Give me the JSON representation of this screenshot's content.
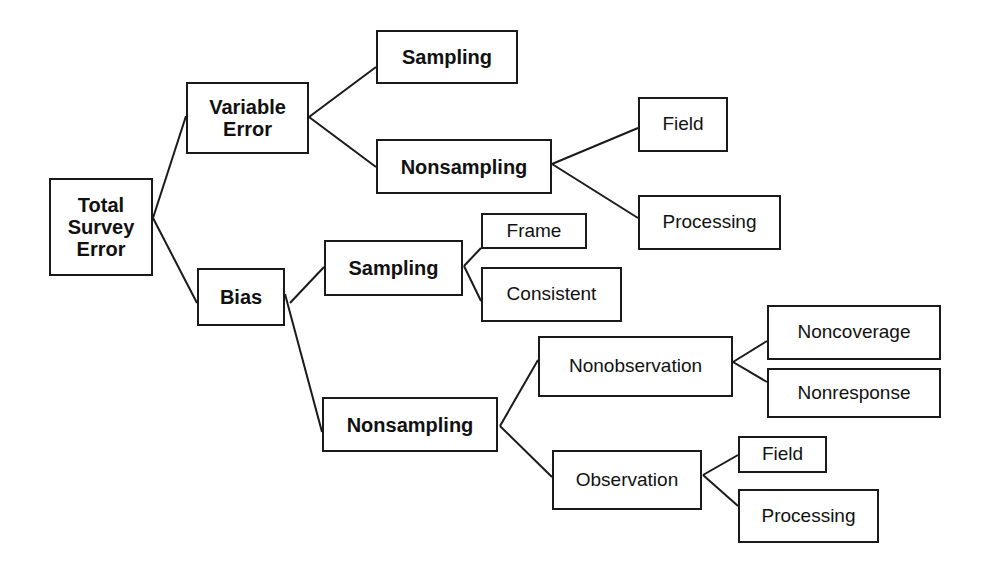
{
  "diagram": {
    "line_color": "#1a1a1a",
    "nodes": [
      {
        "id": "total",
        "label": "Total Survey Error",
        "lines": [
          "Total",
          "Survey",
          "Error"
        ],
        "x": 49,
        "y": 178,
        "w": 104,
        "h": 98,
        "bold": true
      },
      {
        "id": "variable",
        "label": "Variable Error",
        "lines": [
          "Variable",
          "Error"
        ],
        "x": 186,
        "y": 82,
        "w": 123,
        "h": 72,
        "bold": true
      },
      {
        "id": "bias",
        "label": "Bias",
        "lines": [
          "Bias"
        ],
        "x": 197,
        "y": 268,
        "w": 88,
        "h": 58,
        "bold": true
      },
      {
        "id": "var_sampling",
        "label": "Sampling",
        "lines": [
          "Sampling"
        ],
        "x": 376,
        "y": 30,
        "w": 142,
        "h": 54,
        "bold": true
      },
      {
        "id": "var_nonsampling",
        "label": "Nonsampling",
        "lines": [
          "Nonsampling"
        ],
        "x": 376,
        "y": 139,
        "w": 176,
        "h": 55,
        "bold": true
      },
      {
        "id": "var_field",
        "label": "Field",
        "lines": [
          "Field"
        ],
        "x": 638,
        "y": 97,
        "w": 90,
        "h": 55,
        "bold": false
      },
      {
        "id": "var_processing",
        "label": "Processing",
        "lines": [
          "Processing"
        ],
        "x": 638,
        "y": 195,
        "w": 143,
        "h": 55,
        "bold": false
      },
      {
        "id": "bias_sampling",
        "label": "Sampling",
        "lines": [
          "Sampling"
        ],
        "x": 324,
        "y": 240,
        "w": 139,
        "h": 56,
        "bold": true
      },
      {
        "id": "frame",
        "label": "Frame",
        "lines": [
          "Frame"
        ],
        "x": 481,
        "y": 213,
        "w": 106,
        "h": 36,
        "bold": false
      },
      {
        "id": "consistent",
        "label": "Consistent",
        "lines": [
          "Consistent"
        ],
        "x": 481,
        "y": 267,
        "w": 141,
        "h": 55,
        "bold": false
      },
      {
        "id": "bias_nonsampling",
        "label": "Nonsampling",
        "lines": [
          "Nonsampling"
        ],
        "x": 322,
        "y": 397,
        "w": 176,
        "h": 55,
        "bold": true
      },
      {
        "id": "nonobservation",
        "label": "Nonobservation",
        "lines": [
          "Nonobservation"
        ],
        "x": 538,
        "y": 336,
        "w": 195,
        "h": 61,
        "bold": false
      },
      {
        "id": "noncoverage",
        "label": "Noncoverage",
        "lines": [
          "Noncoverage"
        ],
        "x": 767,
        "y": 305,
        "w": 174,
        "h": 55,
        "bold": false
      },
      {
        "id": "nonresponse",
        "label": "Nonresponse",
        "lines": [
          "Nonresponse"
        ],
        "x": 767,
        "y": 368,
        "w": 174,
        "h": 50,
        "bold": false
      },
      {
        "id": "observation",
        "label": "Observation",
        "lines": [
          "Observation"
        ],
        "x": 552,
        "y": 450,
        "w": 150,
        "h": 60,
        "bold": false
      },
      {
        "id": "obs_field",
        "label": "Field",
        "lines": [
          "Field"
        ],
        "x": 738,
        "y": 436,
        "w": 89,
        "h": 37,
        "bold": false
      },
      {
        "id": "obs_processing",
        "label": "Processing",
        "lines": [
          "Processing"
        ],
        "x": 738,
        "y": 489,
        "w": 141,
        "h": 54,
        "bold": false
      }
    ],
    "edges": [
      {
        "from": "total",
        "to": "variable",
        "x1": 153,
        "y1": 218,
        "x2": 186,
        "y2": 116
      },
      {
        "from": "total",
        "to": "bias",
        "x1": 153,
        "y1": 218,
        "x2": 197,
        "y2": 303
      },
      {
        "from": "variable",
        "to": "var_sampling",
        "x1": 309,
        "y1": 117,
        "x2": 376,
        "y2": 67
      },
      {
        "from": "variable",
        "to": "var_nonsampling",
        "x1": 309,
        "y1": 117,
        "x2": 376,
        "y2": 167
      },
      {
        "from": "var_nonsampling",
        "to": "var_field",
        "x1": 552,
        "y1": 164,
        "x2": 638,
        "y2": 128
      },
      {
        "from": "var_nonsampling",
        "to": "var_processing",
        "x1": 552,
        "y1": 164,
        "x2": 638,
        "y2": 218
      },
      {
        "from": "bias",
        "to": "bias_sampling",
        "x1": 290,
        "y1": 303,
        "x2": 324,
        "y2": 267
      },
      {
        "from": "bias",
        "to": "bias_nonsampling",
        "x1": 285,
        "y1": 294,
        "x2": 322,
        "y2": 432
      },
      {
        "from": "bias_sampling",
        "to": "frame",
        "x1": 464,
        "y1": 266,
        "x2": 481,
        "y2": 248
      },
      {
        "from": "bias_sampling",
        "to": "consistent",
        "x1": 464,
        "y1": 266,
        "x2": 481,
        "y2": 301
      },
      {
        "from": "bias_nonsampling",
        "to": "nonobservation",
        "x1": 500,
        "y1": 426,
        "x2": 538,
        "y2": 360
      },
      {
        "from": "bias_nonsampling",
        "to": "observation",
        "x1": 500,
        "y1": 426,
        "x2": 552,
        "y2": 477
      },
      {
        "from": "nonobservation",
        "to": "noncoverage",
        "x1": 733,
        "y1": 362,
        "x2": 767,
        "y2": 341
      },
      {
        "from": "nonobservation",
        "to": "nonresponse",
        "x1": 733,
        "y1": 362,
        "x2": 767,
        "y2": 382
      },
      {
        "from": "observation",
        "to": "obs_field",
        "x1": 703,
        "y1": 475,
        "x2": 738,
        "y2": 455
      },
      {
        "from": "observation",
        "to": "obs_processing",
        "x1": 703,
        "y1": 475,
        "x2": 738,
        "y2": 506
      }
    ]
  }
}
